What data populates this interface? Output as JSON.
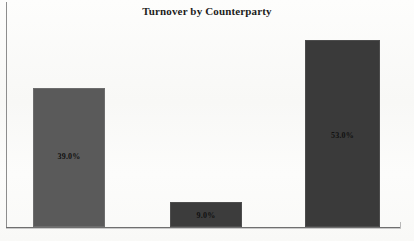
{
  "chart_data": {
    "type": "bar",
    "title": "Turnover by Counterparty",
    "xlabel": "",
    "ylabel": "",
    "categories": [
      "Counterparty 1",
      "Counterparty 2",
      "Counterparty 3"
    ],
    "values": [
      39.0,
      9.0,
      53.0
    ],
    "data_labels": [
      "39.0%",
      "9.0%",
      "53.0%"
    ],
    "ylim": [
      0,
      56
    ],
    "grid": false,
    "legend": false,
    "axis_tick_labels": [],
    "colors": {
      "bar_1": "#5a5a5a",
      "bar_2": "#3c3c3c",
      "bar_3": "#3a3a3a",
      "axis": "#6f6f6f",
      "frame": "#8d8d8d",
      "label_text": "#111111",
      "title_text": "#1d1d1d",
      "background": "#fbfbfa"
    }
  },
  "bars": [
    {
      "name": "bar-39",
      "label": "39.0%",
      "left": 33,
      "width": 72,
      "top": 88,
      "height": 139,
      "color": "#5a5a5a",
      "border": "#6d6d6d",
      "label_top": 63
    },
    {
      "name": "bar-9",
      "label": "9.0%",
      "left": 170,
      "width": 72,
      "top": 202,
      "height": 25,
      "color": "#3c3c3c",
      "border": "#4e4e4e",
      "label_top": 8
    },
    {
      "name": "bar-53",
      "label": "53.0%",
      "left": 305,
      "width": 75,
      "top": 40,
      "height": 187,
      "color": "#3a3a3a",
      "border": "#4c4c4c",
      "label_top": 90
    }
  ]
}
